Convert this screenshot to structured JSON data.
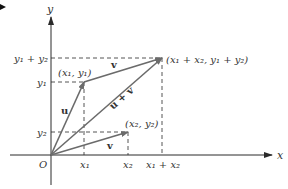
{
  "diagram": {
    "axes": {
      "x_label": "x",
      "y_label": "y",
      "origin_label": "O"
    },
    "points": {
      "p1": "(x₁, y₁)",
      "p2": "(x₂, y₂)",
      "sum": "(x₁ + x₂, y₁ + y₂)"
    },
    "x_ticks": [
      "x₁",
      "x₂",
      "x₁ + x₂"
    ],
    "y_ticks": [
      "y₁ + y₂",
      "y₁",
      "y₂"
    ],
    "vectors": {
      "u": "u",
      "v_top": "v",
      "v_bottom": "v",
      "sum": "u + v"
    },
    "colors": {
      "vector": "#6b6b6b",
      "axis": "#3a3a3a",
      "dashed": "#555555",
      "text": "#333333"
    }
  }
}
